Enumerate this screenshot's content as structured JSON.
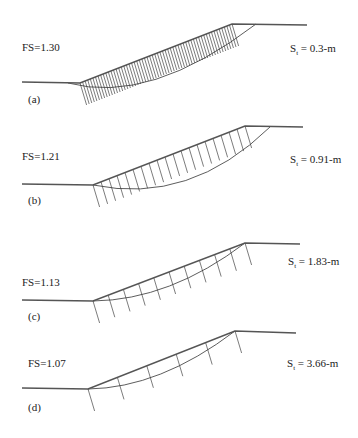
{
  "figure": {
    "panels": [
      {
        "id": "a",
        "label": "(a)",
        "fs_label": "FS=1.30",
        "spacing_label_prefix": "S",
        "spacing_label_sub": "t",
        "spacing_label_value": " = 0.3-m",
        "fs_pos": [
          22,
          51
        ],
        "label_pos": [
          28,
          103
        ],
        "spacing_pos": [
          290,
          52
        ],
        "ground": [
          [
            22,
            82
          ],
          [
            80,
            83
          ],
          [
            232,
            24
          ],
          [
            307,
            25
          ]
        ],
        "slip": "M 68 83 Q 150 105 256 24",
        "nail_count": 60,
        "nail_length": 22,
        "toe": [
          80,
          83
        ],
        "crest": [
          232,
          24
        ]
      },
      {
        "id": "b",
        "label": "(b)",
        "fs_label": "FS=1.21",
        "spacing_label_prefix": "S",
        "spacing_label_sub": "t",
        "spacing_label_value": " = 0.91-m",
        "fs_pos": [
          22,
          160
        ],
        "label_pos": [
          28,
          204
        ],
        "spacing_pos": [
          290,
          163
        ],
        "ground": [
          [
            22,
            184
          ],
          [
            93,
            185
          ],
          [
            245,
            126
          ],
          [
            303,
            127
          ]
        ],
        "slip": "M 93 185 Q 190 205 270 127",
        "nail_count": 20,
        "nail_length": 22,
        "toe": [
          93,
          185
        ],
        "crest": [
          245,
          126
        ]
      },
      {
        "id": "c",
        "label": "(c)",
        "fs_label": "FS=1.13",
        "spacing_label_prefix": "S",
        "spacing_label_sub": "t",
        "spacing_label_value": " = 1.83-m",
        "fs_pos": [
          22,
          286
        ],
        "label_pos": [
          28,
          320
        ],
        "spacing_pos": [
          288,
          265
        ],
        "ground": [
          [
            22,
            300
          ],
          [
            93,
            301
          ],
          [
            245,
            243
          ],
          [
            300,
            244
          ]
        ],
        "slip": "M 93 301 Q 170 300 245 243",
        "nail_count": 11,
        "nail_length": 22,
        "toe": [
          93,
          301
        ],
        "crest": [
          245,
          243
        ]
      },
      {
        "id": "d",
        "label": "(d)",
        "fs_label": "FS=1.07",
        "spacing_label_prefix": "S",
        "spacing_label_sub": "t",
        "spacing_label_value": " = 3.66-m",
        "fs_pos": [
          28,
          367
        ],
        "label_pos": [
          28,
          411
        ],
        "spacing_pos": [
          287,
          367
        ],
        "ground": [
          [
            22,
            388
          ],
          [
            88,
            389
          ],
          [
            235,
            331
          ],
          [
            296,
            333
          ]
        ],
        "slip": "M 88 389 Q 160 388 235 331",
        "nail_count": 6,
        "nail_length": 22,
        "toe": [
          88,
          389
        ],
        "crest": [
          235,
          331
        ]
      }
    ],
    "colors": {
      "ground": "#555555",
      "slip": "#333333",
      "nail": "#444444",
      "text": "#222222"
    }
  }
}
